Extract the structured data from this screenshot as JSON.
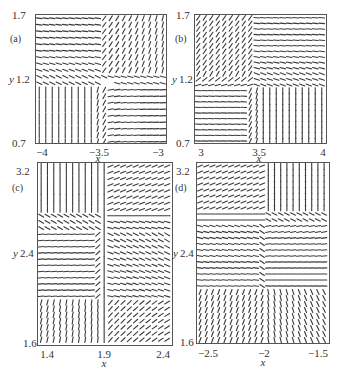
{
  "chart_data": [
    {
      "type": "vector-field",
      "panel_label": "(a)",
      "xlabel": "x",
      "ylabel": "y",
      "xlim": [
        -4,
        -3
      ],
      "ylim": [
        0.7,
        1.7
      ],
      "xticks": [
        "-4",
        "-3.5",
        "-3"
      ],
      "yticks": [
        "0.7",
        "1.2",
        "1.7"
      ],
      "description": "Direction field with saddle-like structure near (-3.5, 1.2): top-left horizontal flow, top-right diagonal, bottom-left vertical, bottom-right horizontal",
      "quadrants": {
        "top_left": "horizontal",
        "top_right": "diagonal-steep",
        "bottom_left": "vertical",
        "bottom_right": "horizontal"
      },
      "center": [
        -3.48,
        1.28
      ]
    },
    {
      "type": "vector-field",
      "panel_label": "(b)",
      "xlabel": "x",
      "ylabel": "y",
      "xlim": [
        3,
        4
      ],
      "ylim": [
        0.7,
        1.7
      ],
      "xticks": [
        "3",
        "3.5",
        "4"
      ],
      "yticks": [
        "0.7",
        "1.2",
        "1.7"
      ],
      "description": "Direction field with critical point near (3.45, 1.22): top-left diagonal, top-right horizontal, bottom-left horizontal, bottom-right vertical",
      "quadrants": {
        "top_left": "diagonal",
        "top_right": "horizontal",
        "bottom_left": "horizontal",
        "bottom_right": "vertical"
      },
      "center": [
        3.44,
        1.24
      ]
    },
    {
      "type": "vector-field",
      "panel_label": "(c)",
      "xlabel": "x",
      "ylabel": "y",
      "xlim": [
        1.4,
        2.4
      ],
      "ylim": [
        1.6,
        3.2
      ],
      "xticks": [
        "1.4",
        "1.9",
        "2.4"
      ],
      "yticks": [
        "1.6",
        "2.4",
        "3.2"
      ],
      "description": "Direction field with cross-shaped separatrices near x=1.9 and y≈2.75 / y≈2.0: top-left vertical, top-right slanted horizontal, middle-left horizontal, middle-right curving, bottom slanted",
      "quadrants": {
        "top_left": "vertical",
        "top_right": "diagonal-shallow",
        "mid_left": "horizontal",
        "mid_right": "curved",
        "bottom_left": "slanted-vertical",
        "bottom_right": "diagonal"
      },
      "center": [
        1.9,
        2.75
      ]
    },
    {
      "type": "vector-field",
      "panel_label": "(d)",
      "xlabel": "x",
      "ylabel": "y",
      "xlim": [
        -2.5,
        -1.5
      ],
      "ylim": [
        1.6,
        3.2
      ],
      "xticks": [
        "-2.5",
        "-2",
        "-1.5"
      ],
      "yticks": [
        "1.6",
        "2.4",
        "3.2"
      ],
      "description": "Direction field with separatrix near x=-2 and horizontal boundaries near y≈2.9 and y≈2.1: top-left diagonal-shallow, top-right vertical, middle horizontal, bottom diagonal",
      "quadrants": {
        "top_left": "diagonal-shallow",
        "top_right": "vertical",
        "mid_left": "horizontal",
        "mid_right": "horizontal-curved",
        "bottom_left": "diagonal-steep",
        "bottom_right": "slanted"
      },
      "center": [
        -2.0,
        2.1
      ]
    }
  ],
  "panels": [
    {
      "label": "(a)",
      "x_axis_label": "x",
      "y_axis_label": "y",
      "xticks": [
        "−4",
        "−3.5",
        "−3"
      ],
      "ytop": "1.7",
      "ymid": "1.2",
      "ybot": "0.7"
    },
    {
      "label": "(b)",
      "x_axis_label": "x",
      "y_axis_label": "y",
      "xticks": [
        "3",
        "3.5",
        "4"
      ],
      "ytop": "1.7",
      "ymid": "1.2",
      "ybot": "0.7"
    },
    {
      "label": "(c)",
      "x_axis_label": "x",
      "y_axis_label": "y",
      "xticks": [
        "1.4",
        "1.9",
        "2.4"
      ],
      "ytop": "3.2",
      "ymid": "2.4",
      "ybot": "1.6"
    },
    {
      "label": "(d)",
      "x_axis_label": "x",
      "y_axis_label": "y",
      "xticks": [
        "−2.5",
        "−2",
        "−1.5"
      ],
      "ytop": "3.2",
      "ymid": "2.4",
      "ybot": "1.6"
    }
  ],
  "colors": {
    "stroke": "#3a3a3a",
    "frame": "#555555",
    "background": "#ffffff"
  }
}
